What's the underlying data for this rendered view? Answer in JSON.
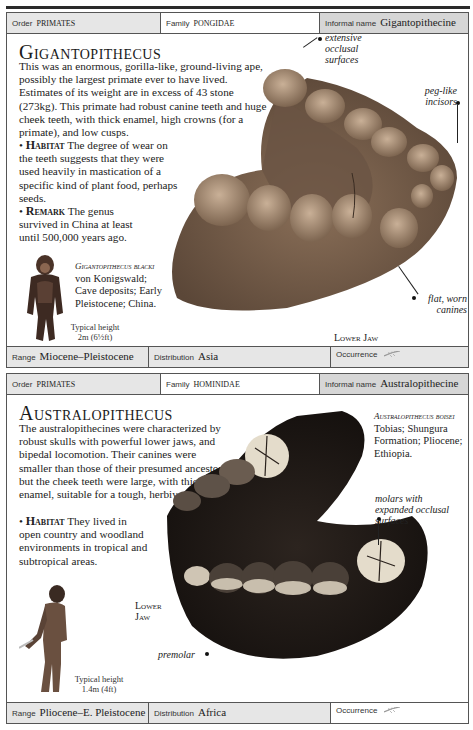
{
  "cards": [
    {
      "header": {
        "order_label": "Order",
        "order_value": "Primates",
        "family_label": "Family",
        "family_value": "Pongidae",
        "informal_label": "Informal name",
        "informal_value": "Gigantopithecine"
      },
      "title": "Gigantopithecus",
      "description": "This was an enormous, gorilla-like, ground-living ape, possibly the largest primate ever to have lived. Estimates of its weight are in excess of 43 stone (273kg). This primate had robust canine teeth and huge cheek teeth, with thick enamel, high crowns (for a primate), and low cusps.",
      "habitat_label": "Habitat",
      "habitat_text": "The degree of wear on the teeth suggests that they were used heavily in mastication of a specific kind of plant food, perhaps seeds.",
      "remark_label": "Remark",
      "remark_text": "The genus survived in China at least until 500,000 years ago.",
      "species_name": "Gigantopithecus blacki",
      "species_info": "von Konigswald; Cave deposits; Early Pleistocene; China.",
      "height_label": "Typical height",
      "height_value": "2m (6½ft)",
      "annotations": {
        "a1": "extensive occlusal surfaces",
        "a2": "peg-like incisors",
        "a3": "flat, worn canines"
      },
      "jaw_label": "Lower Jaw",
      "footer": {
        "range_label": "Range",
        "range_value": "Miocene–Pleistocene",
        "distribution_label": "Distribution",
        "distribution_value": "Asia",
        "occurrence_label": "Occurrence",
        "occurrence_icon": "fern-icon"
      }
    },
    {
      "header": {
        "order_label": "Order",
        "order_value": "Primates",
        "family_label": "Family",
        "family_value": "Hominidae",
        "informal_label": "Informal name",
        "informal_value": "Australopithecine"
      },
      "title": "Australopithecus",
      "description": "The australopithecines were characterized by robust skulls with powerful lower jaws, and bipedal locomotion. Their canines were smaller than those of their presumed ancestors, but the cheek teeth were large, with thick enamel, suitable for a tough, herbivorous diet.",
      "habitat_label": "Habitat",
      "habitat_text": "They lived in open country and woodland environments in tropical and subtropical areas.",
      "species_name": "Australopithecus boisei",
      "species_info": "Tobias; Shungura Formation; Pliocene; Ethiopia.",
      "height_label": "Typical height",
      "height_value": "1.4m (4ft)",
      "annotations": {
        "a1": "molars with expanded occlusal surfaces",
        "a2": "premolar"
      },
      "jaw_label": "Lower Jaw",
      "footer": {
        "range_label": "Range",
        "range_value": "Pliocene–E. Pleistocene",
        "distribution_label": "Distribution",
        "distribution_value": "Africa",
        "occurrence_label": "Occurrence",
        "occurrence_icon": "fern-icon"
      }
    }
  ]
}
